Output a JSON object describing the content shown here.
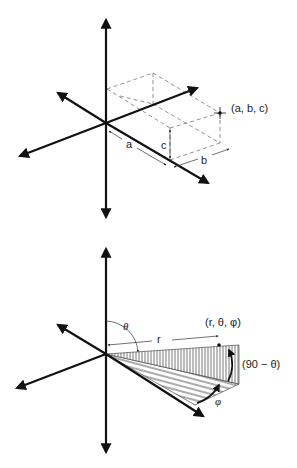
{
  "figure": {
    "panels": [
      {
        "id": "cartesian",
        "title": "Cartesian coordinates",
        "labels": {
          "point": "(a, b, c)",
          "a": "a",
          "b": "b",
          "c": "c"
        }
      },
      {
        "id": "spherical",
        "title": "Spherical coordinates",
        "labels": {
          "point": "(r, θ, φ)",
          "r": "r",
          "theta": "θ",
          "complement": "(90 − θ)",
          "phi": "φ"
        }
      }
    ]
  },
  "colors": {
    "ink": "#111111",
    "dash": "#777777",
    "background": "#ffffff"
  }
}
